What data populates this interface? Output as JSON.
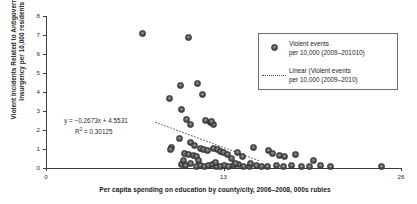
{
  "chart_data": {
    "type": "scatter",
    "title": "",
    "xlabel": "Per capita spending on education by county/city, 2006–2008, 000s rubles",
    "ylabel": "Violent Incidents Related to Antigovernment Insurgency per 10,000 residents",
    "xlim": [
      0,
      26
    ],
    "ylim": [
      0,
      8
    ],
    "xticks": [
      0,
      13,
      26
    ],
    "xtick_labels": [
      "0",
      "13",
      "26"
    ],
    "yticks": [
      0,
      1,
      2,
      3,
      4,
      5,
      6,
      7,
      8
    ],
    "ytick_labels": [
      "0",
      "1",
      "2",
      "3",
      "4",
      "5",
      "6",
      "7",
      "8"
    ],
    "grid": false,
    "legend_position": "upper right",
    "annotations": {
      "equation_line1": "y = −0.2673x + 4.5531",
      "equation_line2_prefix": "R",
      "equation_line2_sup": "2",
      "equation_line2_suffix": " = 0.30125",
      "slope": -0.2673,
      "intercept": 4.5531,
      "r_squared": 0.30125
    },
    "series": [
      {
        "name": "Violent events per 10,000 (2009–201010)",
        "type": "scatter",
        "marker": "circle",
        "color": "#4a4a4a",
        "points": [
          [
            7.1,
            7.08
          ],
          [
            10.4,
            6.85
          ],
          [
            9.05,
            3.64
          ],
          [
            9.85,
            4.35
          ],
          [
            11.1,
            4.46
          ],
          [
            11.45,
            3.88
          ],
          [
            9.95,
            3.1
          ],
          [
            10.3,
            2.55
          ],
          [
            10.55,
            2.28
          ],
          [
            11.7,
            2.52
          ],
          [
            12.05,
            2.42
          ],
          [
            12.25,
            2.3
          ],
          [
            12.15,
            2.45
          ],
          [
            9.75,
            1.55
          ],
          [
            9.2,
            1.1
          ],
          [
            9.15,
            0.98
          ],
          [
            10.55,
            1.32
          ],
          [
            10.9,
            1.18
          ],
          [
            11.35,
            1.05
          ],
          [
            11.55,
            0.98
          ],
          [
            11.8,
            0.92
          ],
          [
            10.15,
            0.78
          ],
          [
            10.45,
            0.72
          ],
          [
            10.8,
            0.68
          ],
          [
            11.05,
            0.62
          ],
          [
            12.3,
            1.02
          ],
          [
            12.55,
            0.95
          ],
          [
            12.75,
            0.88
          ],
          [
            13.0,
            0.8
          ],
          [
            13.3,
            0.72
          ],
          [
            13.6,
            0.52
          ],
          [
            14.0,
            0.82
          ],
          [
            14.4,
            0.6
          ],
          [
            15.2,
            1.1
          ],
          [
            16.3,
            0.92
          ],
          [
            16.6,
            0.78
          ],
          [
            17.1,
            0.68
          ],
          [
            17.5,
            0.58
          ],
          [
            18.3,
            0.72
          ],
          [
            19.6,
            0.4
          ],
          [
            9.9,
            0.18
          ],
          [
            10.2,
            0.12
          ],
          [
            10.6,
            0.22
          ],
          [
            11.0,
            0.1
          ],
          [
            11.3,
            0.15
          ],
          [
            11.6,
            0.08
          ],
          [
            11.9,
            0.12
          ],
          [
            12.2,
            0.18
          ],
          [
            12.5,
            0.1
          ],
          [
            12.8,
            0.06
          ],
          [
            13.1,
            0.14
          ],
          [
            13.4,
            0.08
          ],
          [
            13.7,
            0.12
          ],
          [
            14.1,
            0.16
          ],
          [
            14.5,
            0.1
          ],
          [
            14.9,
            0.08
          ],
          [
            15.4,
            0.14
          ],
          [
            15.8,
            0.1
          ],
          [
            16.2,
            0.08
          ],
          [
            16.9,
            0.12
          ],
          [
            17.4,
            0.1
          ],
          [
            18.0,
            0.14
          ],
          [
            18.7,
            0.08
          ],
          [
            19.3,
            0.1
          ],
          [
            20.1,
            0.12
          ],
          [
            20.8,
            0.08
          ],
          [
            24.6,
            0.1
          ],
          [
            10.05,
            0.38
          ],
          [
            11.15,
            0.42
          ],
          [
            12.4,
            0.3
          ],
          [
            13.9,
            0.26
          ],
          [
            15.0,
            0.22
          ]
        ]
      },
      {
        "name": "Linear (Violent events per 10,000 (2009–2010)",
        "type": "line",
        "style": "dotted",
        "color": "#4a4a4a",
        "x_from": 8.0,
        "x_to": 15.6
      }
    ],
    "legend_entries": [
      {
        "sample": "marker",
        "line1": "Violent events",
        "line2": "per 10,000 (2009–201010)"
      },
      {
        "sample": "dotted-line",
        "line1": "Linear (Violent events",
        "line2": "per 10,000 (2009–2010)"
      }
    ]
  }
}
